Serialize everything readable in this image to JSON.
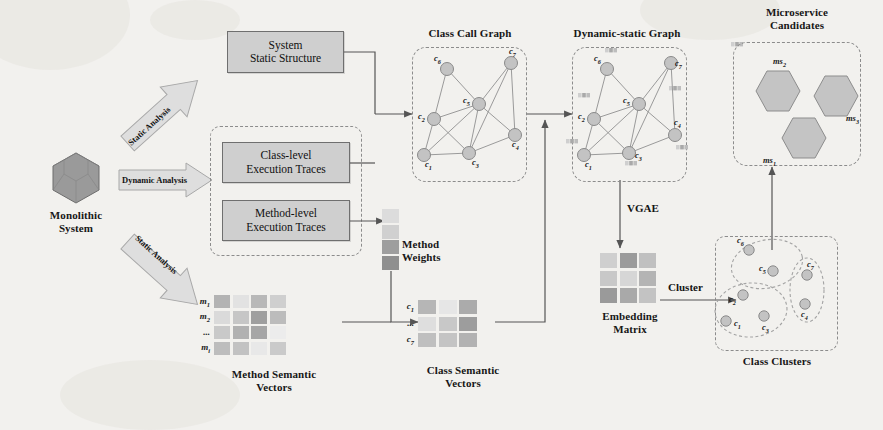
{
  "figure": {
    "background_color": "#f2f1ee",
    "box_fill": "#cfcfcf",
    "box_stroke": "#6f6f6f",
    "dash_stroke": "#8c8c8c",
    "node_fill": "#c3c3c3",
    "node_stroke": "#8a8a8a"
  },
  "source": {
    "label": "Monolithic\nSystem",
    "icon": "hexagon-solid-icon"
  },
  "analysis_arrows": [
    {
      "label": "Static Analysis",
      "direction": "up-right"
    },
    {
      "label": "Dynamic Analysis",
      "direction": "right"
    },
    {
      "label": "Static Analysis",
      "direction": "down-right"
    }
  ],
  "process_boxes": [
    {
      "id": "system-static-structure",
      "label": "System\nStatic Structure"
    },
    {
      "id": "class-level-execution-traces",
      "label": "Class-level\nExecution Traces"
    },
    {
      "id": "method-level-execution-traces",
      "label": "Method-level\nExecution Traces"
    }
  ],
  "dynamic_group": {
    "name": "dynamic-analysis-group"
  },
  "class_call_graph": {
    "caption": "Class Call  Graph",
    "nodes": [
      {
        "id": "c6",
        "label": "c",
        "sub": "6",
        "x": 35,
        "y": 22,
        "lx": -13,
        "ly": -11
      },
      {
        "id": "c7",
        "label": "c",
        "sub": "7",
        "x": 99,
        "y": 16,
        "lx": -2,
        "ly": -12
      },
      {
        "id": "c5",
        "label": "c",
        "sub": "5",
        "x": 67,
        "y": 57,
        "lx": -16,
        "ly": -4
      },
      {
        "id": "c2",
        "label": "c",
        "sub": "2",
        "x": 22,
        "y": 72,
        "lx": -16,
        "ly": -3
      },
      {
        "id": "c1",
        "label": "c",
        "sub": "1",
        "x": 12,
        "y": 108,
        "lx": 1,
        "ly": 9
      },
      {
        "id": "c3",
        "label": "c",
        "sub": "3",
        "x": 57,
        "y": 106,
        "lx": 3,
        "ly": 9
      },
      {
        "id": "c4",
        "label": "c",
        "sub": "4",
        "x": 103,
        "y": 88,
        "lx": -3,
        "ly": 9
      }
    ],
    "edges": [
      [
        "c6",
        "c5"
      ],
      [
        "c6",
        "c2"
      ],
      [
        "c7",
        "c5"
      ],
      [
        "c7",
        "c4"
      ],
      [
        "c7",
        "c3"
      ],
      [
        "c5",
        "c2"
      ],
      [
        "c5",
        "c3"
      ],
      [
        "c5",
        "c4"
      ],
      [
        "c2",
        "c1"
      ],
      [
        "c2",
        "c3"
      ],
      [
        "c1",
        "c3"
      ],
      [
        "c3",
        "c4"
      ],
      [
        "c5",
        "c1"
      ]
    ]
  },
  "dynamic_static_graph": {
    "caption": "Dynamic-static Graph",
    "nodes": [
      {
        "id": "c6",
        "label": "c",
        "sub": "6",
        "x": 35,
        "y": 22,
        "lx": -13,
        "ly": -11,
        "fx": -2,
        "fy": -21
      },
      {
        "id": "c7",
        "label": "c",
        "sub": "7",
        "x": 99,
        "y": 16,
        "lx": 4,
        "ly": 0,
        "fx": 60,
        "fy": -21
      },
      {
        "id": "c5",
        "label": "c",
        "sub": "5",
        "x": 67,
        "y": 57,
        "lx": -16,
        "ly": -4,
        "fx": 30,
        "fy": -18
      },
      {
        "id": "c2",
        "label": "c",
        "sub": "2",
        "x": 22,
        "y": 72,
        "lx": -16,
        "ly": -3,
        "fx": -16,
        "fy": -26
      },
      {
        "id": "c1",
        "label": "c",
        "sub": "1",
        "x": 12,
        "y": 108,
        "lx": 1,
        "ly": 9,
        "fx": -18,
        "fy": -16
      },
      {
        "id": "c3",
        "label": "c",
        "sub": "3",
        "x": 57,
        "y": 106,
        "lx": 6,
        "ly": 2,
        "fx": -4,
        "fy": 8
      },
      {
        "id": "c4",
        "label": "c",
        "sub": "4",
        "x": 103,
        "y": 88,
        "lx": -1,
        "ly": -13,
        "fx": 1,
        "fy": 10
      }
    ],
    "edges": [
      [
        "c6",
        "c5"
      ],
      [
        "c6",
        "c2"
      ],
      [
        "c7",
        "c5"
      ],
      [
        "c7",
        "c4"
      ],
      [
        "c7",
        "c3"
      ],
      [
        "c5",
        "c2"
      ],
      [
        "c5",
        "c3"
      ],
      [
        "c5",
        "c4"
      ],
      [
        "c2",
        "c1"
      ],
      [
        "c2",
        "c3"
      ],
      [
        "c1",
        "c3"
      ],
      [
        "c3",
        "c4"
      ],
      [
        "c5",
        "c1"
      ]
    ],
    "feature_swatch": "node-feature-vector"
  },
  "microservice_candidates": {
    "caption": "Microservice\nCandidates",
    "items": [
      {
        "id": "ms2",
        "label": "ms",
        "sub": "2",
        "x": 22,
        "y": 28,
        "lx": 18,
        "ly": -14
      },
      {
        "id": "ms3",
        "label": "ms",
        "sub": "3",
        "x": 80,
        "y": 33,
        "lx": 33,
        "ly": 38
      },
      {
        "id": "ms1",
        "label": "ms",
        "sub": "1",
        "x": 48,
        "y": 75,
        "lx": -18,
        "ly": 38
      }
    ]
  },
  "method_weights": {
    "caption": "Method\nWeights",
    "cells": [
      "#dcdcdc",
      "#d0d0d0",
      "#9e9e9e",
      "#8f8f8f"
    ]
  },
  "method_semantic_vectors": {
    "caption": "Method Semantic\nVectors",
    "row_labels": [
      {
        "label": "m",
        "sub": "1"
      },
      {
        "label": "m",
        "sub": "2"
      },
      {
        "label": "...",
        "sub": ""
      },
      {
        "label": "m",
        "sub": "i"
      }
    ],
    "grid": [
      [
        "#b3b3b3",
        "#e2e2e2",
        "#b8b8b8",
        "#cfcfcf"
      ],
      [
        "#dadada",
        "#c6c6c6",
        "#9f9f9f",
        "#bcbcbc"
      ],
      [
        "#c9c9c9",
        "#b1b1b1",
        "#a6a6a6",
        "#ececec"
      ],
      [
        "#bdbdbd",
        "#c2c2c2",
        "#e8e8e8",
        "#cacaca"
      ]
    ]
  },
  "class_semantic_vectors": {
    "caption": "Class Semantic\nVectors",
    "row_labels": [
      {
        "label": "c",
        "sub": "1"
      },
      {
        "label": "...",
        "sub": ""
      },
      {
        "label": "c",
        "sub": "7"
      }
    ],
    "grid": [
      [
        "#b6b6b6",
        "#e6e6e6",
        "#ababab"
      ],
      [
        "#dedede",
        "#c8c8c8",
        "#9d9d9d"
      ],
      [
        "#bfbfbf",
        "#c4c4c4",
        "#b2b2b2"
      ]
    ]
  },
  "embedding_matrix": {
    "caption": "Embedding\nMatrix",
    "grid": [
      [
        "#cfcfcf",
        "#9b9b9b",
        "#c0c0c0"
      ],
      [
        "#c8c8c8",
        "#d6d6d6",
        "#b4b4b4"
      ],
      [
        "#9a9a9a",
        "#a9a9a9",
        "#c3c3c3"
      ]
    ]
  },
  "class_clusters": {
    "caption": "Class Clusters",
    "clusters": [
      {
        "id": "cluster-top",
        "nodes": [
          {
            "id": "c6",
            "label": "c",
            "sub": "6",
            "x": 34,
            "y": 14,
            "lx": -12,
            "ly": -10
          },
          {
            "id": "c5",
            "label": "c",
            "sub": "5",
            "x": 58,
            "y": 35,
            "lx": -14,
            "ly": -3
          }
        ]
      },
      {
        "id": "cluster-bottom",
        "nodes": [
          {
            "id": "c2",
            "label": "c",
            "sub": "2",
            "x": 28,
            "y": 59,
            "lx": -14,
            "ly": 4
          },
          {
            "id": "c1",
            "label": "c",
            "sub": "1",
            "x": 11,
            "y": 85,
            "lx": 8,
            "ly": 2
          },
          {
            "id": "c3",
            "label": "c",
            "sub": "3",
            "x": 49,
            "y": 80,
            "lx": -2,
            "ly": 11
          }
        ]
      },
      {
        "id": "cluster-right",
        "nodes": [
          {
            "id": "c7",
            "label": "c",
            "sub": "7",
            "x": 92,
            "y": 39,
            "lx": 0,
            "ly": -11
          },
          {
            "id": "c4",
            "label": "c",
            "sub": "4",
            "x": 90,
            "y": 68,
            "lx": -4,
            "ly": 10
          }
        ]
      }
    ]
  },
  "flow_labels": [
    {
      "id": "vgae",
      "text": "VGAE"
    },
    {
      "id": "cluster",
      "text": "Cluster"
    }
  ]
}
